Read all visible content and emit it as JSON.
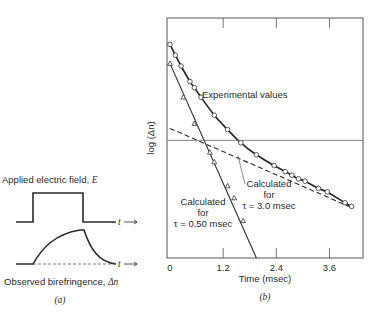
{
  "panel_a": {
    "top_label": "Applied electric field, ",
    "top_symbol": "E",
    "bottom_label": "Observed birefringence, ",
    "bottom_symbol": "Δn",
    "axis_symbol": "t",
    "caption": "(a)",
    "pulse": {
      "on_fraction": 0.22,
      "off_fraction": 0.66
    }
  },
  "chart_data": {
    "type": "scatter",
    "title": "",
    "caption": "(b)",
    "xlabel": "Time (msec)",
    "ylabel": "log (Δn)",
    "xlim": [
      0,
      4.37
    ],
    "ylim": [
      0,
      10
    ],
    "x_ticks": [
      0,
      1.2,
      2.4,
      3.6
    ],
    "x_tick_labels": [
      "0",
      "1.2",
      "2.4",
      "3.6"
    ],
    "y_ticks": [],
    "reference_line_y": 4.9,
    "series": [
      {
        "name": "Experimental values",
        "marker": "circle",
        "line": "solid-thick",
        "points": [
          [
            0.0,
            8.9
          ],
          [
            0.12,
            8.45
          ],
          [
            0.25,
            8.0
          ],
          [
            0.45,
            7.35
          ],
          [
            0.55,
            7.1
          ],
          [
            0.7,
            6.7
          ],
          [
            1.0,
            5.95
          ],
          [
            1.3,
            5.35
          ],
          [
            1.6,
            4.8
          ],
          [
            1.95,
            4.3
          ],
          [
            2.35,
            3.85
          ],
          [
            2.6,
            3.6
          ],
          [
            2.75,
            3.45
          ],
          [
            2.9,
            3.3
          ],
          [
            3.05,
            3.2
          ],
          [
            3.35,
            2.9
          ],
          [
            3.55,
            2.75
          ],
          [
            3.95,
            2.3
          ],
          [
            4.1,
            2.15
          ]
        ]
      },
      {
        "name": "Calculated for τ = 0.50 msec",
        "marker": "triangle",
        "line": "solid",
        "points": [
          [
            0.0,
            8.1
          ],
          [
            0.3,
            6.7
          ],
          [
            0.55,
            5.6
          ],
          [
            0.9,
            4.4
          ],
          [
            1.0,
            4.0
          ],
          [
            1.3,
            3.0
          ],
          [
            1.45,
            2.5
          ],
          [
            1.65,
            1.55
          ],
          [
            1.95,
            0.0
          ]
        ]
      },
      {
        "name": "Calculated for τ = 3.0 msec",
        "marker": "none",
        "line": "dashed",
        "points": [
          [
            0.0,
            5.4
          ],
          [
            4.1,
            2.1
          ]
        ]
      }
    ],
    "annotations": [
      {
        "text": "Experimental values",
        "target_series": 0
      },
      {
        "line1": "Calculated",
        "line2": "for",
        "line3": "τ = 3.0 msec",
        "target_series": 2
      },
      {
        "line1": "Calculated",
        "line2": "for",
        "line3": "τ = 0.50 msec",
        "target_series": 1
      }
    ]
  }
}
